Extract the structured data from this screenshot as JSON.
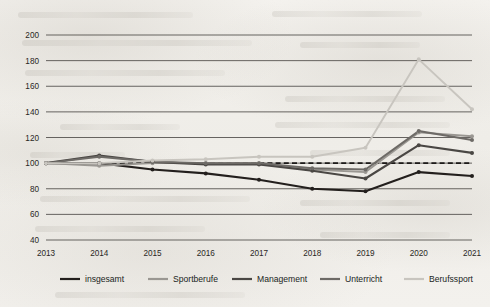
{
  "chart_data": {
    "type": "line",
    "title": "",
    "xlabel": "",
    "ylabel": "",
    "categories": [
      "2013",
      "2014",
      "2015",
      "2016",
      "2017",
      "2018",
      "2019",
      "2020",
      "2021"
    ],
    "x": [
      2013,
      2014,
      2015,
      2016,
      2017,
      2018,
      2019,
      2020,
      2021
    ],
    "ylim": [
      40,
      200
    ],
    "yticks": [
      40,
      60,
      80,
      100,
      120,
      140,
      160,
      180,
      200
    ],
    "ytick_labels": [
      "40",
      "60",
      "80",
      "100",
      "120",
      "140",
      "160",
      "180",
      "200"
    ],
    "grid": true,
    "grid_axis": "y",
    "reference_line": {
      "value": 100,
      "style": "dashed",
      "color": "#1c1a18"
    },
    "legend_position": "bottom",
    "index_base": 100,
    "series": [
      {
        "name": "insgesamt",
        "color": "#231f1d",
        "width": 2.1,
        "markers": true,
        "values": [
          100,
          100,
          95,
          92,
          87,
          80,
          78,
          93,
          90
        ]
      },
      {
        "name": "Sportberufe",
        "color": "#9a9792",
        "width": 1.9,
        "markers": true,
        "values": [
          100,
          98,
          100,
          100,
          100,
          95,
          93,
          124,
          121
        ]
      },
      {
        "name": "Management",
        "color": "#4a4744",
        "width": 2.1,
        "markers": true,
        "values": [
          100,
          106,
          101,
          99,
          99,
          94,
          88,
          114,
          108
        ]
      },
      {
        "name": "Unterricht",
        "color": "#6d6a66",
        "width": 2.0,
        "markers": true,
        "values": [
          100,
          105,
          101,
          100,
          100,
          96,
          95,
          125,
          118
        ]
      },
      {
        "name": "Berufssport",
        "color": "#c8c5bf",
        "width": 1.9,
        "markers": true,
        "values": [
          100,
          100,
          102,
          103,
          105,
          105,
          112,
          181,
          142
        ]
      }
    ]
  },
  "legend": {
    "items": [
      {
        "label": "insgesamt",
        "color": "#231f1d"
      },
      {
        "label": "Sportberufe",
        "color": "#9a9792"
      },
      {
        "label": "Management",
        "color": "#4a4744"
      },
      {
        "label": "Unterricht",
        "color": "#6d6a66"
      },
      {
        "label": "Berufssport",
        "color": "#c8c5bf"
      }
    ]
  },
  "style": {
    "gridline_color": "#4f4c49",
    "background": "#f2f0ec",
    "tick_color": "#2a2724"
  }
}
